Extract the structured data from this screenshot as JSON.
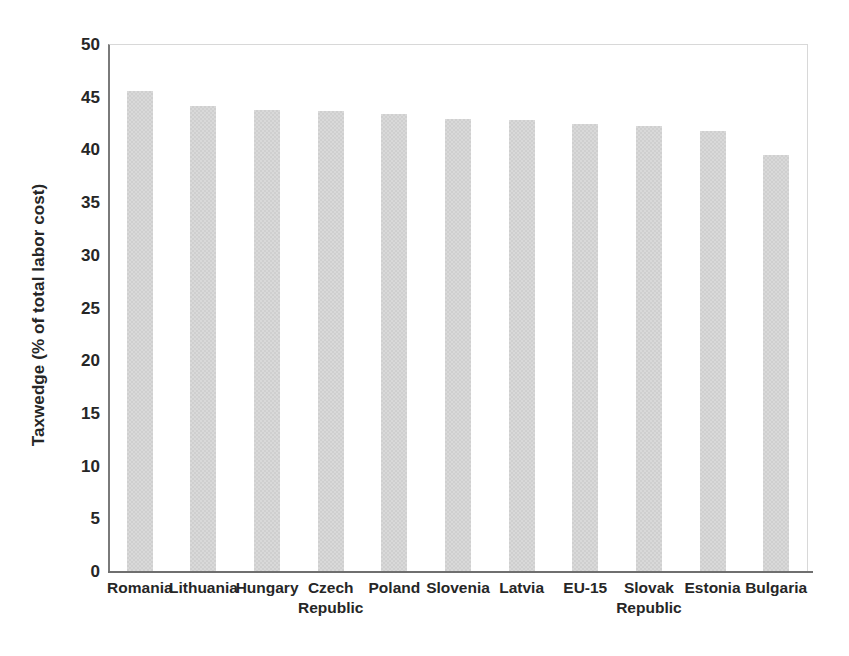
{
  "chart_data": {
    "type": "bar",
    "title": "",
    "subtitle": "",
    "xlabel": "",
    "ylabel": "Taxwedge (% of total labor cost)",
    "ylim": [
      0,
      50
    ],
    "yticks": [
      0,
      5,
      10,
      15,
      20,
      25,
      30,
      35,
      40,
      45,
      50
    ],
    "ytick_labels": [
      "0",
      "5",
      "10",
      "15",
      "20",
      "25",
      "30",
      "35",
      "40",
      "45",
      "50"
    ],
    "grid": false,
    "legend": null,
    "bar_color": "#d9d9d9",
    "axis_color": "#6f6f6f",
    "categories": [
      "Romania",
      "Lithuania",
      "Hungary",
      "Czech Republic",
      "Poland",
      "Slovenia",
      "Latvia",
      "EU-15",
      "Slovak Republic",
      "Estonia",
      "Bulgaria"
    ],
    "category_lines": [
      [
        "Romania",
        ""
      ],
      [
        "Lithuania",
        ""
      ],
      [
        "Hungary",
        ""
      ],
      [
        "Czech",
        "Republic"
      ],
      [
        "Poland",
        ""
      ],
      [
        "Slovenia",
        ""
      ],
      [
        "Latvia",
        ""
      ],
      [
        "EU-15",
        ""
      ],
      [
        "Slovak",
        "Republic"
      ],
      [
        "Estonia",
        ""
      ],
      [
        "Bulgaria",
        ""
      ]
    ],
    "values": [
      45.5,
      44.1,
      43.7,
      43.6,
      43.4,
      42.9,
      42.8,
      42.4,
      42.2,
      41.7,
      39.5
    ]
  }
}
